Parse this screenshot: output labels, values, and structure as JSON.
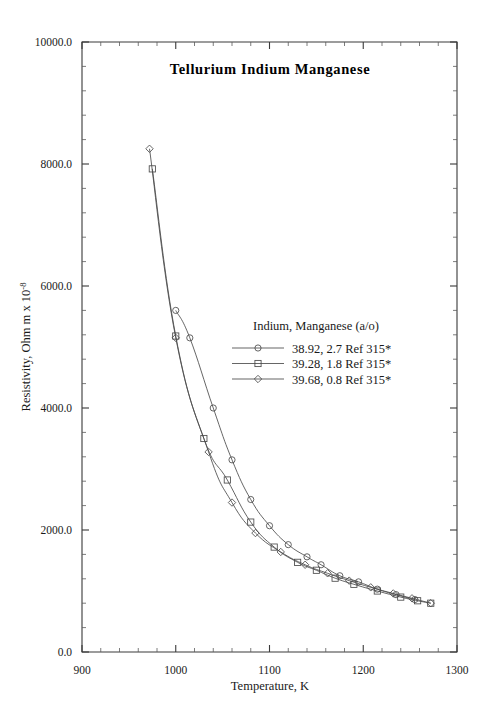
{
  "chart_data": {
    "type": "line",
    "title": "Tellurium  Indium  Manganese",
    "xlabel": "Temperature,  K",
    "ylabel_main": "Resistivity, Ohm m x 10",
    "ylabel_exponent": "-8",
    "xlim": [
      900,
      1300
    ],
    "ylim": [
      0.0,
      10000.0
    ],
    "x_ticks": [
      900,
      1000,
      1100,
      1200,
      1300
    ],
    "x_tick_labels": [
      "900",
      "1000",
      "1100",
      "1200",
      "1300"
    ],
    "y_ticks": [
      0.0,
      2000.0,
      4000.0,
      6000.0,
      8000.0,
      10000.0
    ],
    "y_tick_labels": [
      "0.0",
      "2000.0",
      "4000.0",
      "6000.0",
      "8000.0",
      "10000.0"
    ],
    "x_minor_interval": 20,
    "y_minor_interval": 400,
    "grid": false,
    "legend_position": "center-right-inside",
    "legend_title": "Indium, Manganese (a/o)",
    "series": [
      {
        "name": "38.92, 2.7 Ref 315*",
        "marker": "circle",
        "x": [
          1000,
          1015,
          1040,
          1060,
          1080,
          1100,
          1120,
          1140,
          1155,
          1175,
          1195,
          1215,
          1235,
          1255
        ],
        "y": [
          5600,
          5150,
          4000,
          3150,
          2500,
          2070,
          1760,
          1560,
          1430,
          1250,
          1150,
          1030,
          940,
          860
        ]
      },
      {
        "name": "39.28, 1.8 Ref 315*",
        "marker": "square",
        "x": [
          975,
          1000,
          1030,
          1055,
          1080,
          1105,
          1130,
          1150,
          1170,
          1190,
          1215,
          1240,
          1258,
          1272
        ],
        "y": [
          7920,
          5180,
          3500,
          2820,
          2130,
          1720,
          1470,
          1340,
          1210,
          1110,
          1000,
          900,
          840,
          800
        ]
      },
      {
        "name": "39.68, 0.8 Ref 315*",
        "marker": "diamond",
        "x": [
          972,
          1000,
          1035,
          1060,
          1085,
          1112,
          1138,
          1162,
          1185,
          1208,
          1232,
          1252,
          1272
        ],
        "y": [
          8250,
          5150,
          3280,
          2450,
          1950,
          1640,
          1430,
          1290,
          1170,
          1060,
          960,
          880,
          800
        ]
      }
    ]
  },
  "legend": {
    "heading": "Indium, Manganese (a/o)",
    "entries": [
      {
        "label": "38.92, 2.7 Ref 315*",
        "marker": "circle"
      },
      {
        "label": "39.28, 1.8 Ref 315*",
        "marker": "square"
      },
      {
        "label": "39.68, 0.8 Ref 315*",
        "marker": "diamond"
      }
    ]
  },
  "colors": {
    "ink": "#1a1a1a",
    "axis": "#3a3a3a",
    "data": "#4a4a4a",
    "background": "#ffffff"
  }
}
